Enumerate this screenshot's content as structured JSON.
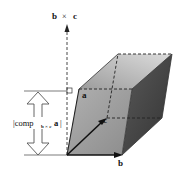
{
  "diagram": {
    "labels": {
      "axis": "b × c",
      "axis_b": "b",
      "axis_times": "×",
      "axis_c": "c",
      "vector_a": "a",
      "vector_b": "b",
      "vector_c": "c",
      "height_prefix": "|comp",
      "height_sub": "b × c",
      "height_vec": "a",
      "height_suffix": "|"
    },
    "colors": {
      "front_face": "#9a9a9a",
      "top_face": "#c8c8c8",
      "right_face": "#4a4a4a",
      "edges": "#222222",
      "arrow_outline": "#555555"
    }
  }
}
